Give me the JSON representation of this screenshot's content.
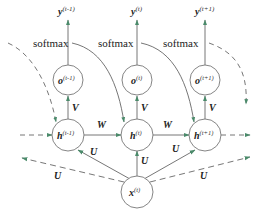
{
  "diagram": {
    "type": "rnn-unrolled-single-input",
    "colors": {
      "arrow": "#4a8a6a",
      "line": "#666666",
      "node_stroke": "#777777",
      "text": "#222222"
    },
    "outputs": [
      {
        "base": "y",
        "sup": "(t-1)"
      },
      {
        "base": "y",
        "sup": "(t)"
      },
      {
        "base": "y",
        "sup": "(t+1)"
      }
    ],
    "activation_label": "softmax",
    "o_nodes": [
      {
        "base": "o",
        "sup": "(t-1)"
      },
      {
        "base": "o",
        "sup": "(t)"
      },
      {
        "base": "o",
        "sup": "(t+1)"
      }
    ],
    "h_nodes": [
      {
        "base": "h",
        "sup": "(t-1)"
      },
      {
        "base": "h",
        "sup": "(t)"
      },
      {
        "base": "h",
        "sup": "(t+1)"
      }
    ],
    "input_node": {
      "base": "x",
      "sup": "(t)"
    },
    "weights": {
      "V": "V",
      "W": "W",
      "U": "U"
    }
  }
}
